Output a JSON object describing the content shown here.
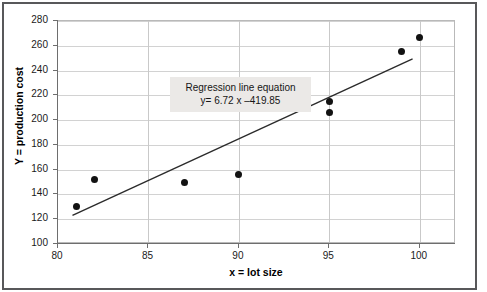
{
  "chart_data": {
    "type": "scatter",
    "title": "",
    "xlabel": "x = lot size",
    "ylabel": "Y = production cost",
    "xlim": [
      80,
      102
    ],
    "ylim": [
      100,
      280
    ],
    "xticks": [
      80,
      85,
      90,
      95,
      100
    ],
    "yticks": [
      100,
      120,
      140,
      160,
      180,
      200,
      220,
      240,
      260,
      280
    ],
    "grid": true,
    "legend": null,
    "points": [
      {
        "x": 81,
        "y": 130
      },
      {
        "x": 82,
        "y": 152
      },
      {
        "x": 87,
        "y": 150
      },
      {
        "x": 90,
        "y": 156
      },
      {
        "x": 93,
        "y": 212
      },
      {
        "x": 93,
        "y": 214
      },
      {
        "x": 95,
        "y": 215
      },
      {
        "x": 95,
        "y": 206
      },
      {
        "x": 99,
        "y": 255
      },
      {
        "x": 100,
        "y": 267
      }
    ],
    "series": [
      {
        "name": "Regression line",
        "type": "line",
        "slope": 6.72,
        "intercept": -419.85,
        "x_start": 80.8,
        "x_end": 99.6
      }
    ],
    "annotations": [
      {
        "name": "regression-equation-box",
        "line1": "Regression line equation",
        "line2": "y= 6.72 x –419.85",
        "x": 112,
        "y": 56
      }
    ],
    "colors": {
      "point": "#121212",
      "line": "#2b2b2b",
      "grid": "#d2d2d2",
      "axis": "#6e6e6e",
      "annotation_background": "#ebe9e7",
      "frame": "#58585a",
      "background": "#ffffff"
    }
  }
}
